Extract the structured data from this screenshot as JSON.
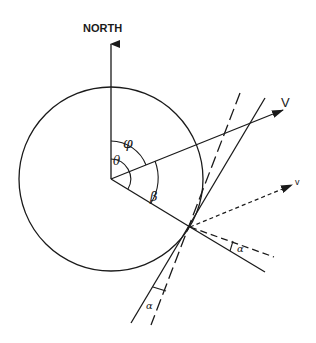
{
  "diagram": {
    "title_label": "NORTH",
    "labels": {
      "phi": "φ",
      "theta": "θ",
      "beta": "β",
      "alpha_upper": "α",
      "alpha_lower": "α",
      "V": "V",
      "v": "v"
    },
    "geometry": {
      "circle_center": [
        111,
        179
      ],
      "circle_radius": 92,
      "tangent_point": [
        190,
        227
      ]
    },
    "colors": {
      "stroke": "#1a1a1a",
      "background": "#ffffff"
    }
  }
}
